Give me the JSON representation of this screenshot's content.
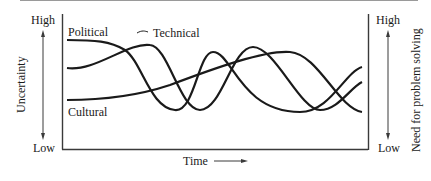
{
  "diagram": {
    "left_axis": {
      "label": "Uncertainty",
      "high": "High",
      "low": "Low"
    },
    "right_axis": {
      "label": "Need for problem solving",
      "high": "High",
      "low": "Low"
    },
    "x_axis": {
      "label": "Time",
      "arrow": "right-arrow"
    },
    "curves": [
      {
        "name": "Political",
        "label": "Political",
        "path": "M67,40 C95,40 110,41 125,50 C142,62 150,108 175,110 C195,112 198,52 213,52 C232,52 240,112 300,112 C330,112 345,72 362,67"
      },
      {
        "name": "Technical",
        "label": "Technical",
        "path": "M67,68 C95,72 128,42 150,45 C168,46 180,110 200,110 C222,110 232,47 253,47 C275,47 300,110 320,110 C338,110 350,88 362,82"
      },
      {
        "name": "Cultural",
        "label": "Cultural",
        "path": "M67,100 C110,100 140,95 170,85 C215,68 265,50 290,52 C318,54 338,108 362,112"
      }
    ],
    "colors": {
      "line": "#1a1a1a",
      "frame": "#3a3a3a",
      "page_edge": "#9a9a9a"
    }
  }
}
